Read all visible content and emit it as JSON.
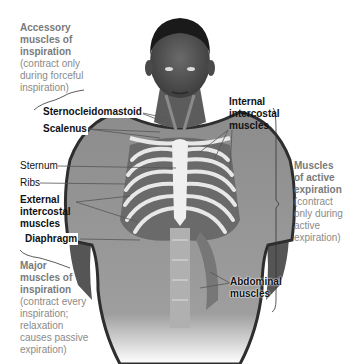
{
  "figure": {
    "colors": {
      "skin": "#5a5a5a",
      "shirt": "#9a9a9a",
      "shirt_edge": "#2e2e2e",
      "bone": "#ececec",
      "muscle": "#707070",
      "label_dark": "#111111",
      "label_gray": "#7a7a7a"
    }
  },
  "groups": {
    "accessory": {
      "title": "Accessory muscles of inspiration",
      "title_lines": [
        "Accessory",
        "muscles of",
        "inspiration"
      ],
      "desc_lines": [
        "(contract only",
        "during forceful",
        "inspiration)"
      ]
    },
    "major": {
      "title": "Major muscles of inspiration",
      "title_lines": [
        "Major",
        "muscles of",
        "inspiration"
      ],
      "desc_lines": [
        "(contract every",
        "inspiration;",
        "relaxation",
        "causes passive",
        "expiration)"
      ]
    },
    "active_expiration": {
      "title": "Muscles of active expiration",
      "title_lines": [
        "Muscles",
        "of active",
        "expiration"
      ],
      "desc_lines": [
        "(contract",
        "only during",
        "active",
        "expiration)"
      ]
    }
  },
  "labels": {
    "sternocleidomastoid": "Sternocleidomastoid",
    "scalenus": "Scalenus",
    "internal_intercostal_lines": [
      "Internal",
      "intercostal",
      "muscles"
    ],
    "sternum": "Sternum",
    "ribs": "Ribs",
    "external_intercostal_lines": [
      "External",
      "intercostal",
      "muscles"
    ],
    "diaphragm": "Diaphragm",
    "abdominal_lines": [
      "Abdominal",
      "muscles"
    ]
  }
}
